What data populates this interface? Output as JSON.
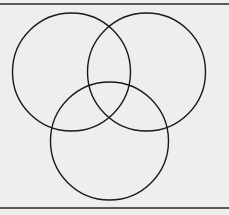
{
  "diagram": {
    "type": "venn",
    "sets": 3,
    "labels": [],
    "colors": {
      "background": "#eeeeec",
      "stroke": "#1a1a1a",
      "border": "#2a2a2a"
    },
    "frame": {
      "top_y": 4,
      "bottom_y": 208
    },
    "circles": [
      {
        "id": "left",
        "cx": 71.5,
        "cy": 72,
        "r": 59
      },
      {
        "id": "right",
        "cx": 146.5,
        "cy": 72,
        "r": 59
      },
      {
        "id": "bottom",
        "cx": 109.5,
        "cy": 141,
        "r": 59
      }
    ]
  }
}
